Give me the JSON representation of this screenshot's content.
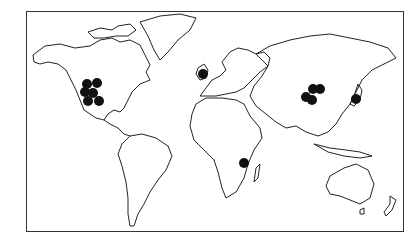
{
  "map": {
    "type": "world-outline",
    "style": "black-and-white line map",
    "frame": {
      "x": 26,
      "y": 11,
      "width": 378,
      "height": 221
    },
    "marker_color": "#111111",
    "marker_radius": 5,
    "markers": [
      {
        "region": "north-america-west",
        "x": 87,
        "y": 84
      },
      {
        "region": "north-america-west",
        "x": 97,
        "y": 83
      },
      {
        "region": "north-america-west",
        "x": 85,
        "y": 92
      },
      {
        "region": "north-america-west",
        "x": 93,
        "y": 93
      },
      {
        "region": "north-america-west",
        "x": 88,
        "y": 101
      },
      {
        "region": "north-america-west",
        "x": 99,
        "y": 101
      },
      {
        "region": "british-isles",
        "x": 203,
        "y": 74
      },
      {
        "region": "east-africa",
        "x": 244,
        "y": 163
      },
      {
        "region": "china",
        "x": 313,
        "y": 89
      },
      {
        "region": "china",
        "x": 320,
        "y": 89
      },
      {
        "region": "china",
        "x": 306,
        "y": 97
      },
      {
        "region": "china",
        "x": 312,
        "y": 100
      },
      {
        "region": "japan",
        "x": 356,
        "y": 99
      }
    ]
  }
}
